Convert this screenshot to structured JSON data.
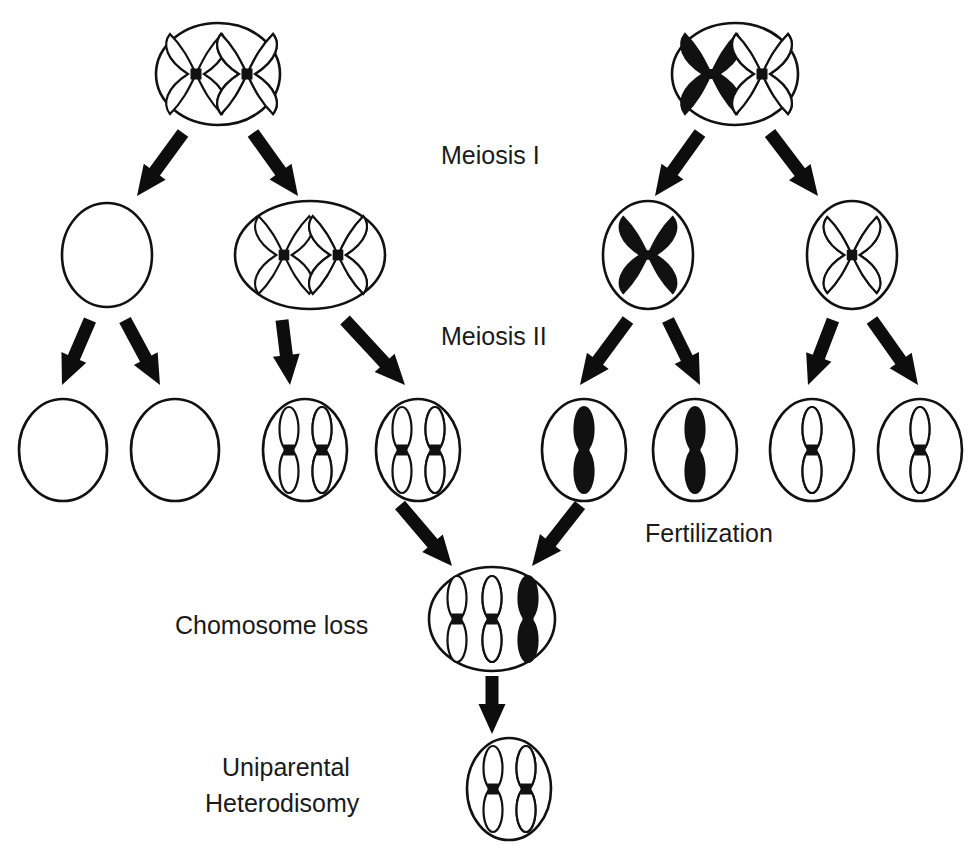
{
  "diagram": {
    "type": "biology-pedigree-flow",
    "width": 975,
    "height": 852,
    "background_color": "#ffffff",
    "ink_color": "#111111"
  },
  "labels": [
    {
      "id": "meiosis-1",
      "text": "Meiosis I",
      "x": 441,
      "y": 157,
      "anchor": "start"
    },
    {
      "id": "meiosis-2",
      "text": "Meiosis II",
      "x": 441,
      "y": 338,
      "anchor": "start"
    },
    {
      "id": "fertilization",
      "text": "Fertilization",
      "x": 645,
      "y": 535,
      "anchor": "start"
    },
    {
      "id": "chromosome-loss",
      "text": "Chomosome loss",
      "x": 175,
      "y": 627,
      "anchor": "start"
    },
    {
      "id": "uniparental-line1",
      "text": "Uniparental",
      "x": 222,
      "y": 769,
      "anchor": "start"
    },
    {
      "id": "uniparental-line2",
      "text": "Heterodisomy",
      "x": 205,
      "y": 805,
      "anchor": "start"
    }
  ],
  "chromosome_styles": {
    "outline": "white with black border",
    "hatched": "white with black diagonal stripes",
    "solid": "filled black"
  },
  "cells": [
    {
      "id": "maternal-germ-cell",
      "row": "parent-maternal",
      "cx": 218,
      "cy": 74,
      "rx": 62,
      "ry": 51,
      "contents": [
        {
          "shape": "x-chromosome",
          "fill": "outline",
          "cx": 196,
          "cy": 74,
          "scale": 1.0
        },
        {
          "shape": "x-chromosome",
          "fill": "hatched",
          "cx": 247,
          "cy": 74,
          "scale": 1.0
        }
      ]
    },
    {
      "id": "paternal-germ-cell",
      "row": "parent-paternal",
      "cx": 735,
      "cy": 74,
      "rx": 63,
      "ry": 51,
      "contents": [
        {
          "shape": "x-chromosome",
          "fill": "solid",
          "cx": 711,
          "cy": 74,
          "scale": 1.0
        },
        {
          "shape": "x-chromosome",
          "fill": "hatched",
          "cx": 762,
          "cy": 74,
          "scale": 1.0
        }
      ]
    },
    {
      "id": "maternal-mi-empty",
      "row": "meiosis-1-products",
      "cx": 107,
      "cy": 255,
      "rx": 45,
      "ry": 52,
      "contents": []
    },
    {
      "id": "maternal-mi-disomic",
      "row": "meiosis-1-products",
      "cx": 310,
      "cy": 255,
      "rx": 75,
      "ry": 54,
      "contents": [
        {
          "shape": "x-chromosome",
          "fill": "outline",
          "cx": 284,
          "cy": 255,
          "scale": 0.97
        },
        {
          "shape": "x-chromosome",
          "fill": "hatched",
          "cx": 338,
          "cy": 255,
          "scale": 0.97
        }
      ]
    },
    {
      "id": "paternal-mi-solid",
      "row": "meiosis-1-products",
      "cx": 648,
      "cy": 255,
      "rx": 45,
      "ry": 54,
      "contents": [
        {
          "shape": "x-chromosome",
          "fill": "solid",
          "cx": 648,
          "cy": 255,
          "scale": 0.95
        }
      ]
    },
    {
      "id": "paternal-mi-hatched",
      "row": "meiosis-1-products",
      "cx": 852,
      "cy": 255,
      "rx": 45,
      "ry": 54,
      "contents": [
        {
          "shape": "x-chromosome",
          "fill": "hatched",
          "cx": 852,
          "cy": 255,
          "scale": 0.95
        }
      ]
    },
    {
      "id": "gamete-empty-1",
      "row": "meiosis-2-products",
      "cx": 63,
      "cy": 450,
      "rx": 44,
      "ry": 51,
      "contents": []
    },
    {
      "id": "gamete-empty-2",
      "row": "meiosis-2-products",
      "cx": 175,
      "cy": 450,
      "rx": 44,
      "ry": 51,
      "contents": []
    },
    {
      "id": "gamete-disomic-1",
      "row": "meiosis-2-products",
      "cx": 305,
      "cy": 450,
      "rx": 42,
      "ry": 51,
      "contents": [
        {
          "shape": "chromatid",
          "fill": "outline",
          "cx": 289,
          "cy": 450,
          "scale": 1.0
        },
        {
          "shape": "chromatid",
          "fill": "hatched",
          "cx": 322,
          "cy": 450,
          "scale": 1.0
        }
      ]
    },
    {
      "id": "gamete-disomic-2",
      "row": "meiosis-2-products",
      "cx": 418,
      "cy": 450,
      "rx": 42,
      "ry": 51,
      "contents": [
        {
          "shape": "chromatid",
          "fill": "outline",
          "cx": 402,
          "cy": 450,
          "scale": 1.0
        },
        {
          "shape": "chromatid",
          "fill": "hatched",
          "cx": 435,
          "cy": 450,
          "scale": 1.0
        }
      ]
    },
    {
      "id": "sperm-solid-1",
      "row": "meiosis-2-products",
      "cx": 584,
      "cy": 450,
      "rx": 42,
      "ry": 51,
      "contents": [
        {
          "shape": "chromatid",
          "fill": "solid",
          "cx": 584,
          "cy": 450,
          "scale": 1.0
        }
      ]
    },
    {
      "id": "sperm-solid-2",
      "row": "meiosis-2-products",
      "cx": 695,
      "cy": 450,
      "rx": 42,
      "ry": 51,
      "contents": [
        {
          "shape": "chromatid",
          "fill": "solid",
          "cx": 695,
          "cy": 450,
          "scale": 1.0
        }
      ]
    },
    {
      "id": "sperm-hatched-1",
      "row": "meiosis-2-products",
      "cx": 812,
      "cy": 450,
      "rx": 42,
      "ry": 51,
      "contents": [
        {
          "shape": "chromatid",
          "fill": "hatched",
          "cx": 812,
          "cy": 450,
          "scale": 1.0
        }
      ]
    },
    {
      "id": "sperm-hatched-2",
      "row": "meiosis-2-products",
      "cx": 920,
      "cy": 450,
      "rx": 42,
      "ry": 51,
      "contents": [
        {
          "shape": "chromatid",
          "fill": "hatched",
          "cx": 920,
          "cy": 450,
          "scale": 1.0
        }
      ]
    },
    {
      "id": "trisomic-zygote",
      "row": "zygote",
      "cx": 492,
      "cy": 619,
      "rx": 63,
      "ry": 52,
      "contents": [
        {
          "shape": "chromatid",
          "fill": "outline",
          "cx": 457,
          "cy": 619,
          "scale": 1.0
        },
        {
          "shape": "chromatid",
          "fill": "hatched",
          "cx": 492,
          "cy": 619,
          "scale": 1.0
        },
        {
          "shape": "chromatid",
          "fill": "solid",
          "cx": 528,
          "cy": 619,
          "scale": 1.0
        }
      ]
    },
    {
      "id": "disomic-rescue-cell",
      "row": "final",
      "cx": 509,
      "cy": 789,
      "rx": 42,
      "ry": 51,
      "contents": [
        {
          "shape": "chromatid",
          "fill": "outline",
          "cx": 493,
          "cy": 789,
          "scale": 1.0
        },
        {
          "shape": "chromatid",
          "fill": "hatched",
          "cx": 526,
          "cy": 789,
          "scale": 1.0
        }
      ]
    }
  ],
  "arrows": [
    {
      "id": "arrow-maternal-left",
      "x1": 183,
      "y1": 133,
      "x2": 137,
      "y2": 196
    },
    {
      "id": "arrow-maternal-right",
      "x1": 253,
      "y1": 133,
      "x2": 298,
      "y2": 196
    },
    {
      "id": "arrow-paternal-left",
      "x1": 700,
      "y1": 133,
      "x2": 655,
      "y2": 196
    },
    {
      "id": "arrow-paternal-right",
      "x1": 770,
      "y1": 133,
      "x2": 818,
      "y2": 196
    },
    {
      "id": "arrow-mi-empty-left",
      "x1": 90,
      "y1": 320,
      "x2": 62,
      "y2": 385
    },
    {
      "id": "arrow-mi-empty-right",
      "x1": 125,
      "y1": 320,
      "x2": 160,
      "y2": 385
    },
    {
      "id": "arrow-mi-disomic-left",
      "x1": 282,
      "y1": 320,
      "x2": 290,
      "y2": 385
    },
    {
      "id": "arrow-mi-disomic-right",
      "x1": 345,
      "y1": 320,
      "x2": 405,
      "y2": 385
    },
    {
      "id": "arrow-solid-left",
      "x1": 628,
      "y1": 320,
      "x2": 580,
      "y2": 385
    },
    {
      "id": "arrow-solid-right",
      "x1": 668,
      "y1": 320,
      "x2": 700,
      "y2": 385
    },
    {
      "id": "arrow-hatched-left",
      "x1": 833,
      "y1": 320,
      "x2": 808,
      "y2": 385
    },
    {
      "id": "arrow-hatched-right",
      "x1": 872,
      "y1": 320,
      "x2": 918,
      "y2": 385
    },
    {
      "id": "arrow-fuse-egg",
      "x1": 400,
      "y1": 505,
      "x2": 452,
      "y2": 566
    },
    {
      "id": "arrow-fuse-sperm",
      "x1": 580,
      "y1": 505,
      "x2": 532,
      "y2": 566
    },
    {
      "id": "arrow-loss",
      "x1": 492,
      "y1": 676,
      "x2": 492,
      "y2": 734
    }
  ]
}
